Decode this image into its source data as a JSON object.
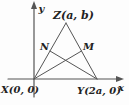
{
  "figure": {
    "labels": {
      "y_axis": "y",
      "x_axis": "x",
      "vertex_x": "X(0, 0)",
      "vertex_y": "Y(2a, 0)",
      "vertex_z": "Z(a, b)",
      "point_n": "N",
      "point_m": "M"
    },
    "colors": {
      "line": "#555555",
      "text": "#222222",
      "background": "#fdfdfd"
    }
  }
}
